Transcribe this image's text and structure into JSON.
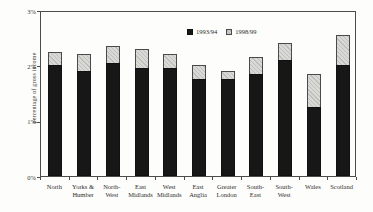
{
  "figure": {
    "ylabel": "percentage of gross income"
  },
  "chart_data": {
    "type": "bar",
    "subtype": "overlay (1998/99 drawn behind 1993/94, same x positions)",
    "title": "",
    "xlabel": "",
    "ylabel": "percentage of gross income",
    "ylim": [
      0,
      3
    ],
    "ytick_labels": [
      "0%",
      "1%",
      "2%",
      "3%"
    ],
    "grid": false,
    "legend_position": "inside top, centered",
    "categories": [
      "North",
      "Yorks & Humber",
      "North-West",
      "East Midlands",
      "West Midlands",
      "East Anglia",
      "Greater London",
      "South-East",
      "South-West",
      "Wales",
      "Scotland"
    ],
    "category_label_lines": [
      [
        "North"
      ],
      [
        "Yorks &",
        "Humber"
      ],
      [
        "North-",
        "West"
      ],
      [
        "East",
        "Midlands"
      ],
      [
        "West",
        "Midlands"
      ],
      [
        "East",
        "Anglia"
      ],
      [
        "Greater",
        "London"
      ],
      [
        "South-",
        "East"
      ],
      [
        "South-",
        "West"
      ],
      [
        "Wales"
      ],
      [
        "Scotland"
      ]
    ],
    "series": [
      {
        "name": "1993/94",
        "color": "#171717",
        "style": "solid black",
        "values": [
          2.0,
          1.9,
          2.05,
          1.95,
          1.95,
          1.75,
          1.75,
          1.85,
          2.1,
          1.25,
          2.0
        ]
      },
      {
        "name": "1998/99",
        "color": "#d9d9d6",
        "style": "light gray hatched",
        "values": [
          2.25,
          2.2,
          2.35,
          2.3,
          2.2,
          2.0,
          1.9,
          2.15,
          2.4,
          1.85,
          2.55
        ]
      }
    ]
  }
}
